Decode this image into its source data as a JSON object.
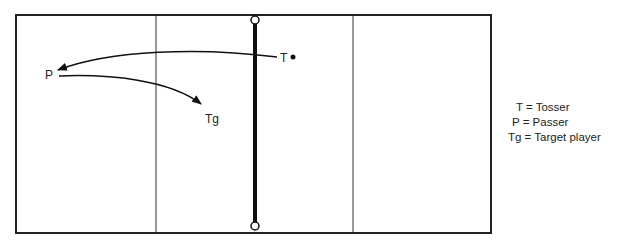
{
  "diagram": {
    "type": "volleyball-court-drill",
    "court": {
      "line_color": "#222222",
      "net_color": "#111111"
    },
    "players": [
      {
        "id": "T",
        "label": "T",
        "role": "Tosser"
      },
      {
        "id": "P",
        "label": "P",
        "role": "Passer"
      },
      {
        "id": "Tg",
        "label": "Tg",
        "role": "Target player"
      }
    ],
    "paths": [
      {
        "from": "T",
        "to": "P",
        "kind": "toss"
      },
      {
        "from": "P",
        "to": "Tg",
        "kind": "pass"
      }
    ],
    "legend": [
      "T = Tosser",
      "P = Passer",
      "Tg = Target player"
    ]
  }
}
